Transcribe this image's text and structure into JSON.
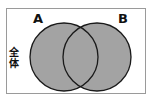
{
  "diagram": {
    "type": "venn",
    "universe_label": "全体",
    "sets": [
      {
        "id": "A",
        "label": "A"
      },
      {
        "id": "B",
        "label": "B"
      }
    ],
    "colors": {
      "fill": "#a3a3a3",
      "stroke": "#1a1a1a",
      "frame": "#9a9a9a",
      "background": "#ffffff"
    }
  }
}
